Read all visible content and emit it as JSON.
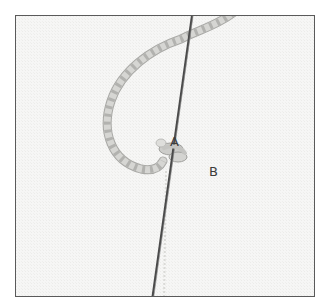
{
  "figure": {
    "labels": {
      "a": "A",
      "b": "B"
    },
    "colors": {
      "fabric": "#f6f6f5",
      "frame_border": "#5a5a5a",
      "needle": "#4a4a4a",
      "thread": "#cfcfcc",
      "thread_shadow": "#a9a9a6",
      "label_text": "#3c3c3c"
    }
  }
}
